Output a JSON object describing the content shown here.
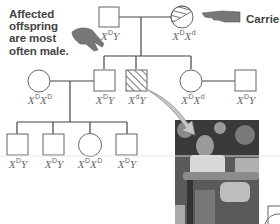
{
  "annotations": {
    "affected_note": [
      "Affected",
      "offspring",
      "are most",
      "often male."
    ],
    "carrier_label": "Carrier"
  },
  "icons": {
    "pointing_hand_left": "pointing-hand-icon",
    "pointing_hand_right": "pointing-hand-icon",
    "callout_arrow": "arrow-icon"
  },
  "pedigree": {
    "generation_1": [
      {
        "sex": "male",
        "status": "unaffected",
        "genotype_base": "X",
        "genotype_allele": "D",
        "genotype_suffix": "Y"
      },
      {
        "sex": "female",
        "status": "carrier",
        "genotype_base": "X",
        "genotype_allele": "D",
        "genotype_base2": "X",
        "genotype_allele2": "d"
      }
    ],
    "generation_2": [
      {
        "sex": "female",
        "status": "unaffected",
        "genotype_base": "X",
        "genotype_allele": "D",
        "genotype_base2": "X",
        "genotype_allele2": "D"
      },
      {
        "sex": "male",
        "status": "unaffected",
        "genotype_base": "X",
        "genotype_allele": "D",
        "genotype_suffix": "Y"
      },
      {
        "sex": "male",
        "status": "affected",
        "genotype_base": "X",
        "genotype_allele": "d",
        "genotype_suffix": "Y"
      },
      {
        "sex": "female",
        "status": "carrier",
        "genotype_base": "X",
        "genotype_allele": "D",
        "genotype_base2": "X",
        "genotype_allele2": "d"
      },
      {
        "sex": "male",
        "status": "unaffected",
        "genotype_base": "X",
        "genotype_allele": "D",
        "genotype_suffix": "Y"
      }
    ],
    "generation_3": [
      {
        "sex": "male",
        "status": "unaffected",
        "genotype_base": "X",
        "genotype_allele": "D",
        "genotype_suffix": "Y"
      },
      {
        "sex": "male",
        "status": "unaffected",
        "genotype_base": "X",
        "genotype_allele": "D",
        "genotype_suffix": "Y"
      },
      {
        "sex": "female",
        "status": "unaffected",
        "genotype_base": "X",
        "genotype_allele": "D",
        "genotype_base2": "X",
        "genotype_allele2": "D"
      },
      {
        "sex": "male",
        "status": "unaffected",
        "genotype_base": "X",
        "genotype_allele": "D",
        "genotype_suffix": "Y"
      }
    ]
  },
  "photo": {
    "description": "child in wheelchair"
  },
  "colors": {
    "line": "#444444",
    "hatch": "#555555",
    "hand": "#777777"
  }
}
